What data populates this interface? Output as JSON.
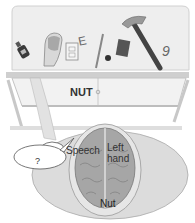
{
  "figure": {
    "type": "split-brain-experiment-illustration",
    "screen_label": "NUT",
    "brain_labels": {
      "speech": "Speech",
      "left_hand": "Left hand",
      "left_hand_line1": "Left",
      "left_hand_line2": "hand",
      "nut": "Nut"
    },
    "speech_bubble": "?",
    "objects_on_table": [
      "bottle-icon",
      "hand-icon",
      "card-icon",
      "letter-e",
      "pencil-icon",
      "nut-ball",
      "eraser-icon",
      "hammer-icon",
      "number-9"
    ],
    "colors": {
      "screen_fill": "#ececec",
      "frame": "#bdbdbd",
      "brain": "#9a9a9a",
      "head": "#d9d9d9"
    }
  }
}
